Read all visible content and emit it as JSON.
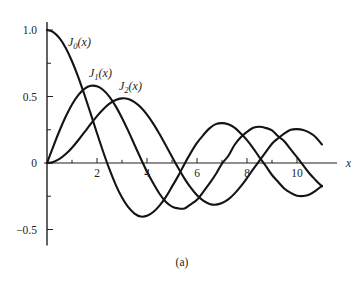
{
  "figure": {
    "caption": "(a)",
    "background_color": "#ffffff",
    "curve_color": "#141414",
    "axis_color": "#231f20"
  },
  "axes": {
    "x_axis_label": "x",
    "y_axis_label": "",
    "x_major_ticks": [
      2,
      4,
      6,
      8,
      10
    ],
    "x_major_tick_labels": [
      "2",
      "4",
      "6",
      "8",
      "10"
    ],
    "x_minor_ticks": [
      1,
      3,
      5,
      7,
      9
    ],
    "y_major_ticks": [
      1.0,
      0.5,
      0,
      -0.5
    ],
    "y_major_tick_labels": [
      "1.0",
      "0.5",
      "0",
      "−0.5"
    ],
    "y_minor_ticks": [
      0.75,
      0.25,
      -0.25
    ],
    "xlim": [
      0,
      11.6
    ],
    "ylim": [
      -0.62,
      1.06
    ],
    "grid": false
  },
  "labels": [
    {
      "name": "J0",
      "base": "J",
      "sub": "0",
      "suffix": "(x)",
      "x": 68,
      "y": 46
    },
    {
      "name": "J1",
      "base": "J",
      "sub": "1",
      "suffix": "(x)",
      "x": 89,
      "y": 77
    },
    {
      "name": "J2",
      "base": "J",
      "sub": "2",
      "suffix": "(x)",
      "x": 119,
      "y": 90
    }
  ],
  "chart_data": {
    "type": "line",
    "title": "",
    "subtitle": "",
    "xlabel": "x",
    "ylabel": "",
    "xlim": [
      0,
      11.6
    ],
    "ylim": [
      -0.62,
      1.06
    ],
    "grid": false,
    "legend": "inline-curve-labels",
    "x_ticks": [
      2,
      4,
      6,
      8,
      10
    ],
    "y_ticks": [
      1.0,
      0.5,
      0,
      -0.5
    ],
    "x": [
      0,
      0.25,
      0.5,
      0.75,
      1,
      1.25,
      1.5,
      1.75,
      2,
      2.25,
      2.5,
      2.75,
      3,
      3.25,
      3.5,
      3.75,
      4,
      4.25,
      4.5,
      4.75,
      5,
      5.25,
      5.5,
      5.75,
      6,
      6.25,
      6.5,
      6.75,
      7,
      7.25,
      7.5,
      7.75,
      8,
      8.25,
      8.5,
      8.75,
      9,
      9.25,
      9.5,
      9.75,
      10,
      10.25,
      10.5,
      10.75,
      11
    ],
    "series": [
      {
        "name": "J_0(x)",
        "label": "J0(x)",
        "values": [
          1.0,
          0.9844,
          0.9385,
          0.8642,
          0.7652,
          0.6459,
          0.5118,
          0.369,
          0.2239,
          0.0827,
          -0.0484,
          -0.1641,
          -0.2601,
          -0.3325,
          -0.3801,
          -0.4026,
          -0.3971,
          -0.3687,
          -0.3205,
          -0.2566,
          -0.1776,
          -0.0968,
          -0.0068,
          0.076,
          0.1506,
          0.2097,
          0.2601,
          0.2921,
          0.3001,
          0.2907,
          0.2663,
          0.2218,
          0.1717,
          0.1104,
          0.0419,
          -0.0221,
          -0.0903,
          -0.1424,
          -0.1939,
          -0.2247,
          -0.2459,
          -0.2484,
          -0.2366,
          -0.2078,
          -0.1712
        ]
      },
      {
        "name": "J_1(x)",
        "label": "J1(x)",
        "values": [
          0.0,
          0.124,
          0.2423,
          0.3492,
          0.4401,
          0.5106,
          0.5579,
          0.5802,
          0.5767,
          0.5484,
          0.4971,
          0.4258,
          0.3391,
          0.2412,
          0.1374,
          0.0339,
          -0.066,
          -0.1528,
          -0.2311,
          -0.2921,
          -0.3276,
          -0.3413,
          -0.3414,
          -0.3109,
          -0.2767,
          -0.2174,
          -0.1538,
          -0.0846,
          -0.0047,
          0.0527,
          0.1352,
          0.1933,
          0.2346,
          0.2646,
          0.2731,
          0.264,
          0.2453,
          0.201,
          0.1613,
          0.1018,
          0.0435,
          -0.0181,
          -0.0789,
          -0.1291,
          -0.1768
        ]
      },
      {
        "name": "J_2(x)",
        "label": "J2(x)",
        "values": [
          0.0,
          0.0078,
          0.0306,
          0.067,
          0.1149,
          0.1711,
          0.2321,
          0.294,
          0.3528,
          0.4048,
          0.4461,
          0.4739,
          0.4861,
          0.4813,
          0.4586,
          0.4194,
          0.3641,
          0.2961,
          0.2178,
          0.1331,
          0.0466,
          -0.038,
          -0.1173,
          -0.1855,
          -0.2429,
          -0.2835,
          -0.3074,
          -0.3133,
          -0.3014,
          -0.2741,
          -0.2303,
          -0.1757,
          -0.113,
          -0.0462,
          0.0184,
          0.0813,
          0.1448,
          0.1865,
          0.2235,
          0.2498,
          0.2546,
          0.2477,
          0.2282,
          0.1944,
          0.139
        ]
      }
    ]
  }
}
